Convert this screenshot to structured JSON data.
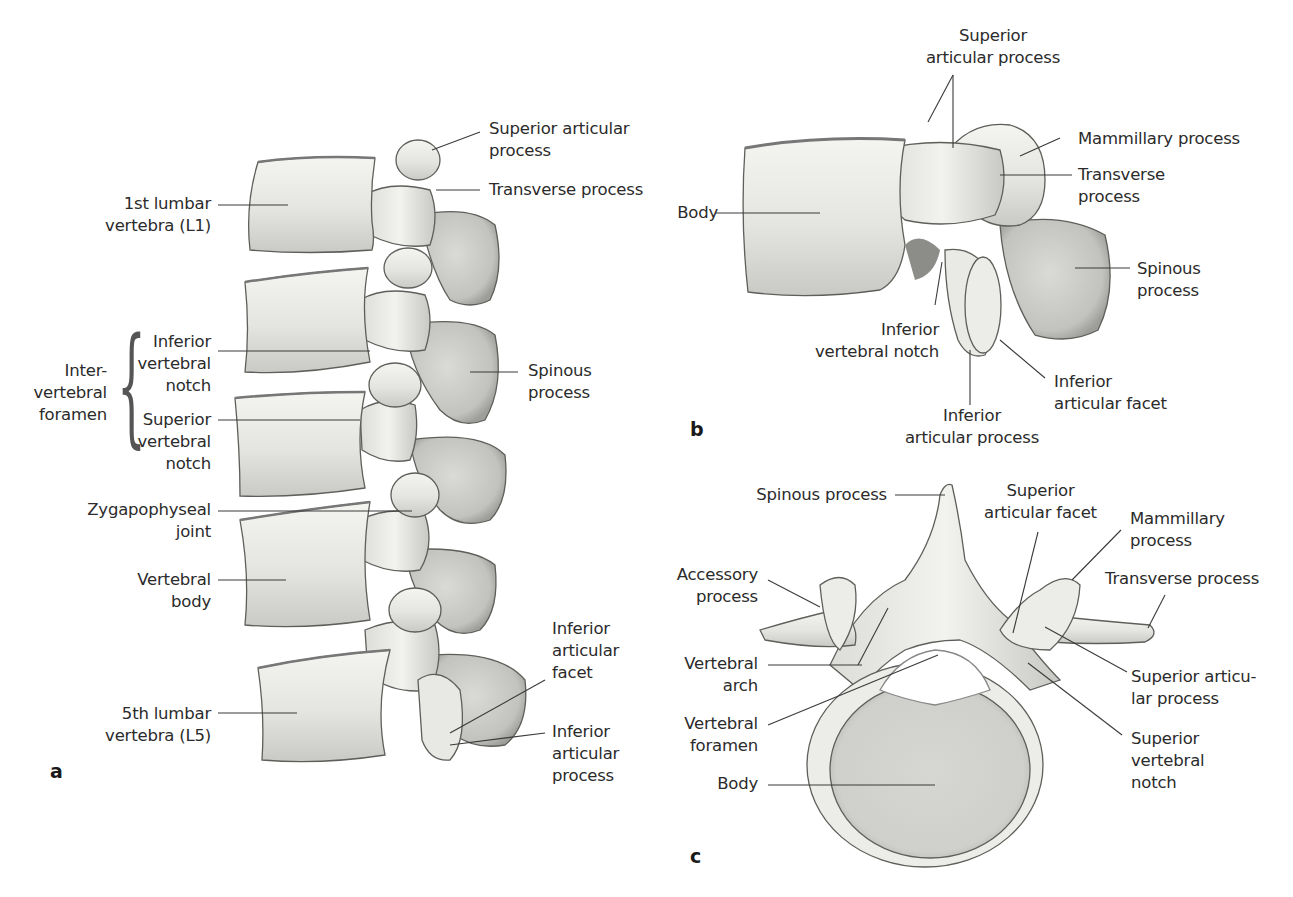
{
  "figure": {
    "colors": {
      "background": "#ffffff",
      "bone_light": "#f1f1ee",
      "bone_mid": "#d6d6d2",
      "bone_shadow": "#9a9a96",
      "bone_outline": "#5e5e5a",
      "leader_line": "#3a3a3a",
      "text": "#2b2b2b"
    },
    "panels": [
      {
        "id": "a",
        "letter": "a",
        "view": "Lumbar spine, left lateral view (L1–L5)",
        "labels": {
          "l1": [
            "1st lumbar",
            "vertebra (L1)"
          ],
          "sup_art_proc": [
            "Superior articular",
            "process"
          ],
          "transverse": [
            "Transverse process"
          ],
          "ivf_group": [
            "Inter-",
            "vertebral",
            "foramen"
          ],
          "inf_vert_notch": [
            "Inferior",
            "vertebral",
            "notch"
          ],
          "sup_vert_notch": [
            "Superior",
            "vertebral",
            "notch"
          ],
          "spinous": [
            "Spinous",
            "process"
          ],
          "zyg_joint": [
            "Zygapophyseal",
            "joint"
          ],
          "vert_body": [
            "Vertebral",
            "body"
          ],
          "l5": [
            "5th lumbar",
            "vertebra (L5)"
          ],
          "inf_art_facet": [
            "Inferior",
            "articular",
            "facet"
          ],
          "inf_art_proc": [
            "Inferior",
            "articular",
            "process"
          ]
        }
      },
      {
        "id": "b",
        "letter": "b",
        "view": "L4 vertebra, left lateral view",
        "labels": {
          "sup_art_proc": [
            "Superior",
            "articular process"
          ],
          "mammillary": [
            "Mammillary process"
          ],
          "transverse": [
            "Transverse",
            "process"
          ],
          "body": [
            "Body"
          ],
          "spinous": [
            "Spinous",
            "process"
          ],
          "inf_vert_notch": [
            "Inferior",
            "vertebral notch"
          ],
          "inf_art_facet": [
            "Inferior",
            "articular facet"
          ],
          "inf_art_proc": [
            "Inferior",
            "articular process"
          ]
        }
      },
      {
        "id": "c",
        "letter": "c",
        "view": "L4 vertebra, superior view",
        "labels": {
          "spinous": [
            "Spinous process"
          ],
          "sup_art_facet": [
            "Superior",
            "articular facet"
          ],
          "mammillary": [
            "Mammillary",
            "process"
          ],
          "accessory": [
            "Accessory",
            "process"
          ],
          "transverse": [
            "Transverse process"
          ],
          "vert_arch": [
            "Vertebral",
            "arch"
          ],
          "sup_art_proc": [
            "Superior articu-",
            "lar process"
          ],
          "vert_foramen": [
            "Vertebral",
            "foramen"
          ],
          "sup_vert_notch": [
            "Superior",
            "vertebral",
            "notch"
          ],
          "body": [
            "Body"
          ]
        }
      }
    ]
  }
}
